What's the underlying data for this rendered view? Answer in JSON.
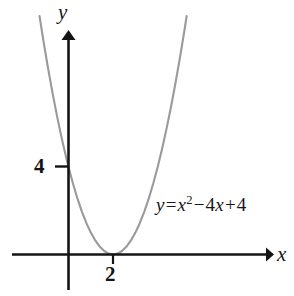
{
  "figure": {
    "background_color": "#ffffff",
    "axis_color": "#141414",
    "curve_color": "#9a9a9a"
  },
  "axes": {
    "x_label": "x",
    "y_label": "y",
    "x_tick_label": "2",
    "y_tick_label": "4"
  },
  "annotation": {
    "equation_lhs": "y",
    "equation_equals": "=",
    "equation_var": "x",
    "equation_exponent": "2",
    "equation_minus": "−",
    "equation_coef": "4",
    "equation_var2": "x",
    "equation_plus": "+",
    "equation_const": "4",
    "equation_full": "y = x² − 4x + 4"
  },
  "chart_data": {
    "type": "line",
    "title": "",
    "xlabel": "x",
    "ylabel": "y",
    "equation": "y = x^2 - 4x + 4",
    "grid": false,
    "legend": null,
    "xlim": [
      -1.2,
      9.1
    ],
    "ylim": [
      -1.6,
      10.2
    ],
    "xticks": [
      2
    ],
    "xticklabels": [
      "2"
    ],
    "yticks": [
      4
    ],
    "yticklabels": [
      "4"
    ],
    "annotations": [
      {
        "text": "y = x² − 4x + 4",
        "x": 4.0,
        "y": 2.6
      }
    ],
    "series": [
      {
        "name": "y = x^2 - 4x + 4",
        "color": "#9a9a9a",
        "x": [
          -1.3,
          -1.1,
          -0.9,
          -0.7,
          -0.5,
          -0.3,
          -0.1,
          0.0,
          0.2,
          0.4,
          0.6,
          0.8,
          1.0,
          1.2,
          1.4,
          1.6,
          1.8,
          2.0,
          2.2,
          2.4,
          2.6,
          2.8,
          3.0,
          3.2,
          3.4,
          3.6,
          3.8,
          4.0,
          4.2,
          4.4,
          4.6,
          4.8,
          5.0,
          5.2,
          5.3
        ],
        "y": [
          10.89,
          9.61,
          8.41,
          7.29,
          6.25,
          5.29,
          4.41,
          4.0,
          3.24,
          2.56,
          1.96,
          1.44,
          1.0,
          0.64,
          0.36,
          0.16,
          0.04,
          0.0,
          0.04,
          0.16,
          0.36,
          0.64,
          1.0,
          1.44,
          1.96,
          2.56,
          3.24,
          4.0,
          4.84,
          5.76,
          6.76,
          7.84,
          9.0,
          10.24,
          10.89
        ]
      }
    ],
    "key_points": [
      {
        "label": "vertex",
        "x": 2,
        "y": 0
      },
      {
        "label": "y-intercept",
        "x": 0,
        "y": 4
      }
    ]
  }
}
